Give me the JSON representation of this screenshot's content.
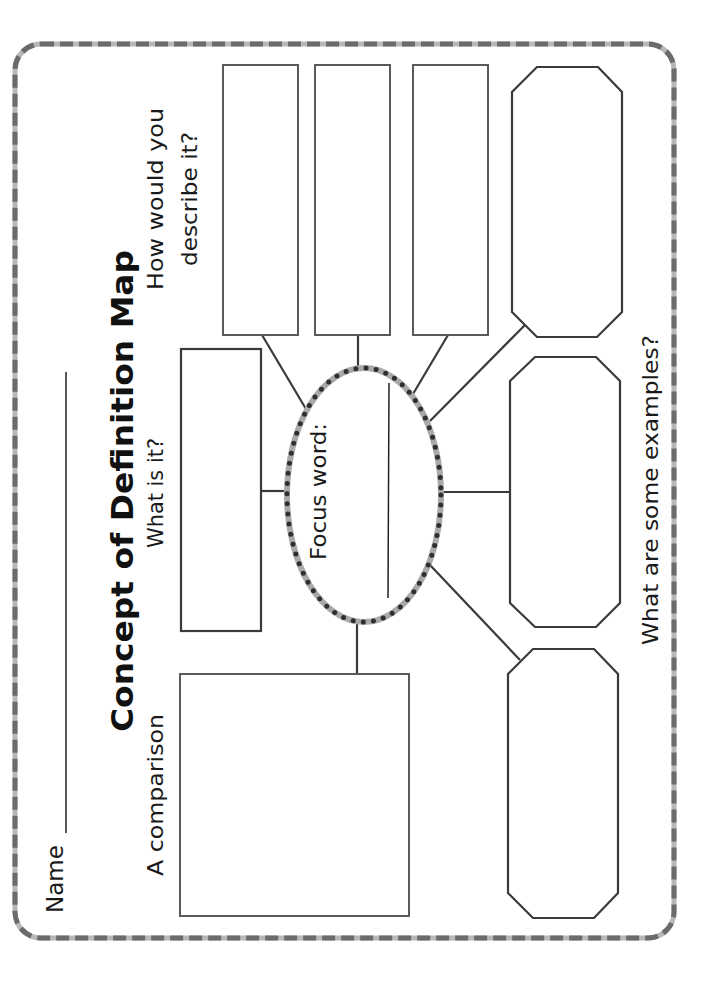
{
  "worksheet": {
    "title": "Concept of Definition Map",
    "name_label": "Name",
    "prompts": {
      "what_is_it": "What is it?",
      "describe_line1": "How would you",
      "describe_line2": "describe it?",
      "comparison": "A comparison",
      "examples": "What are some examples?",
      "focus_word": "Focus word:"
    },
    "colors": {
      "border_dark": "#6b6b6b",
      "border_light": "#b8b8b8",
      "box_stroke": "#5a5a5a",
      "connector": "#3a3a3a",
      "ellipse_stroke": "#a9a9a9",
      "ellipse_dots": "#2f2f2f"
    }
  }
}
